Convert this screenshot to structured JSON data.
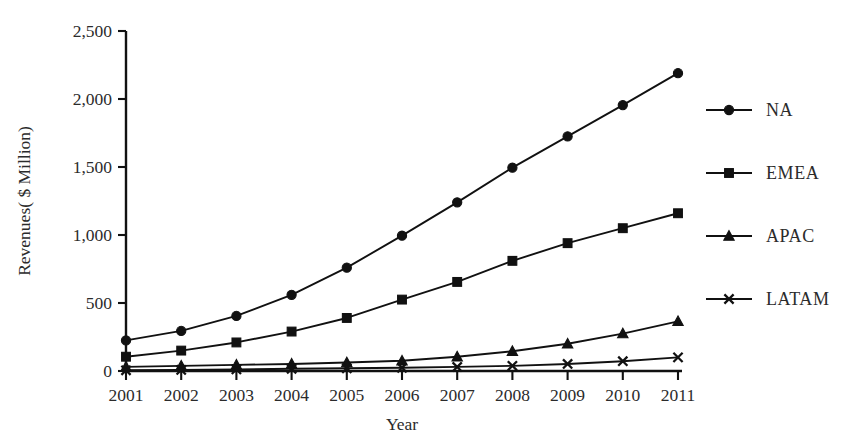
{
  "chart_data": {
    "type": "line",
    "title": "",
    "xlabel": "Year",
    "ylabel": "Revenues( $ Million)",
    "categories": [
      "2001",
      "2002",
      "2003",
      "2004",
      "2005",
      "2006",
      "2007",
      "2008",
      "2009",
      "2010",
      "2011"
    ],
    "x": [
      2001,
      2002,
      2003,
      2004,
      2005,
      2006,
      2007,
      2008,
      2009,
      2010,
      2011
    ],
    "ylim": [
      0,
      2500
    ],
    "xlim": [
      2001,
      2011
    ],
    "yticks": [
      0,
      500,
      1000,
      1500,
      2000,
      2500
    ],
    "ytick_labels": [
      "0",
      "500",
      "1,000",
      "1,500",
      "2,000",
      "2,500"
    ],
    "grid": false,
    "legend_position": "right",
    "series": [
      {
        "name": "NA",
        "marker": "circle",
        "values": [
          225,
          295,
          405,
          560,
          760,
          995,
          1240,
          1495,
          1725,
          1955,
          2190
        ]
      },
      {
        "name": "EMEA",
        "marker": "square",
        "values": [
          105,
          150,
          210,
          290,
          390,
          525,
          655,
          810,
          940,
          1050,
          1160
        ]
      },
      {
        "name": "APAC",
        "marker": "triangle",
        "values": [
          30,
          38,
          45,
          52,
          62,
          75,
          105,
          145,
          200,
          275,
          365
        ]
      },
      {
        "name": "LATAM",
        "marker": "x",
        "values": [
          5,
          8,
          12,
          16,
          20,
          24,
          30,
          38,
          52,
          72,
          100
        ]
      }
    ]
  },
  "legend": {
    "items": [
      {
        "label": "NA",
        "marker": "circle"
      },
      {
        "label": "EMEA",
        "marker": "square"
      },
      {
        "label": "APAC",
        "marker": "triangle"
      },
      {
        "label": "LATAM",
        "marker": "x"
      }
    ]
  }
}
